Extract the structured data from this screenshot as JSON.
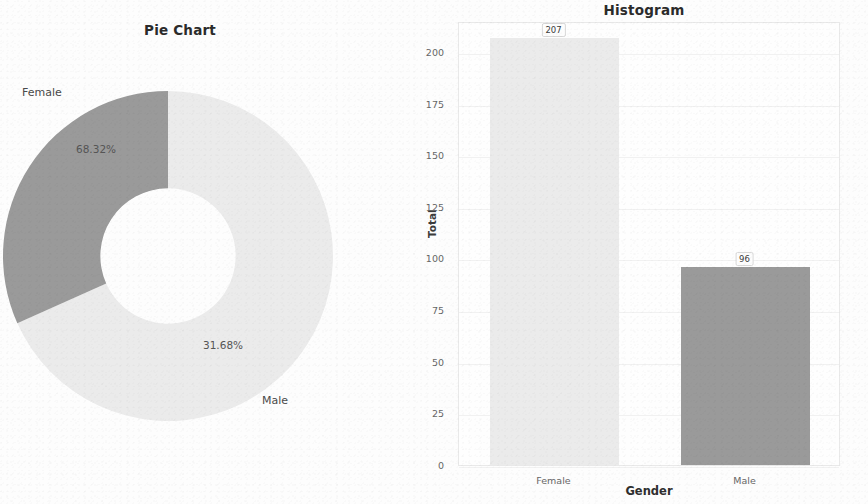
{
  "colors": {
    "female": "#ebebeb",
    "male": "#9a9a9a",
    "background": "#fdfdfd",
    "text": "#3a3a3a",
    "grid": "#f1f1f1",
    "plot_border": "#e9e9e9"
  },
  "pie": {
    "title": "Pie Chart",
    "labels": [
      "Female",
      "Male"
    ],
    "percent_labels": [
      "68.32%",
      "31.68%"
    ]
  },
  "histogram": {
    "title": "Histogram",
    "xlabel": "Gender",
    "ylabel": "Total",
    "categories": [
      "Female",
      "Male"
    ],
    "value_labels": [
      "207",
      "96"
    ],
    "yticks": [
      "0",
      "25",
      "50",
      "75",
      "100",
      "125",
      "150",
      "175",
      "200"
    ]
  },
  "chart_data": [
    {
      "type": "pie",
      "title": "Pie Chart",
      "subtitle": "",
      "donut": true,
      "hole_ratio": 0.41,
      "labels": [
        "Female",
        "Male"
      ],
      "values": [
        68.32,
        31.68
      ],
      "value_unit": "percent",
      "data_labels": [
        "68.32%",
        "31.68%"
      ],
      "colors": [
        "#ebebeb",
        "#9a9a9a"
      ],
      "start_angle_deg": 90,
      "direction": "clockwise",
      "legend": "none",
      "annotations": [
        "Female",
        "Male"
      ]
    },
    {
      "type": "bar",
      "title": "Histogram",
      "categories": [
        "Female",
        "Male"
      ],
      "values": [
        207,
        96
      ],
      "series": [
        {
          "name": "Total",
          "values": [
            207,
            96
          ]
        }
      ],
      "data_labels": [
        "207",
        "96"
      ],
      "colors": [
        "#ebebeb",
        "#9a9a9a"
      ],
      "xlabel": "Gender",
      "ylabel": "Total",
      "ylim": [
        0,
        215
      ],
      "yticks": [
        0,
        25,
        50,
        75,
        100,
        125,
        150,
        175,
        200
      ],
      "ytick_labels": [
        "0",
        "25",
        "50",
        "75",
        "100",
        "125",
        "150",
        "175",
        "200"
      ],
      "grid": true,
      "grid_axis": "y",
      "legend": "none"
    }
  ]
}
